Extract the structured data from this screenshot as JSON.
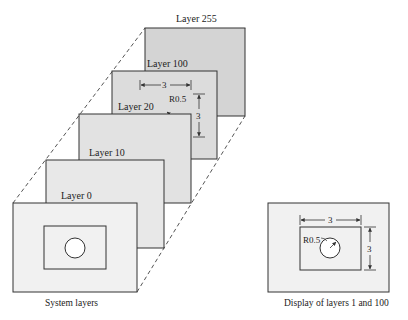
{
  "diagram": {
    "colors": {
      "background": "#ffffff",
      "layer_far": "#d4d4d4",
      "layer_mid": "#dedede",
      "layer_near": "#e6e6e6",
      "layer_front": "#f1f1f1",
      "stroke": "#333333",
      "dash": "#555555"
    },
    "layers": [
      {
        "label": "Layer 255"
      },
      {
        "label": "Layer 100"
      },
      {
        "label": "Layer 20"
      },
      {
        "label": "Layer 10"
      },
      {
        "label": "Layer 0"
      }
    ],
    "layer100_dims": {
      "width": "3",
      "height": "3",
      "radius": "R0.5"
    },
    "left_caption": "System layers",
    "right_panel": {
      "width": "3",
      "height": "3",
      "radius": "R0.5",
      "caption": "Display of layers 1 and 100"
    }
  }
}
